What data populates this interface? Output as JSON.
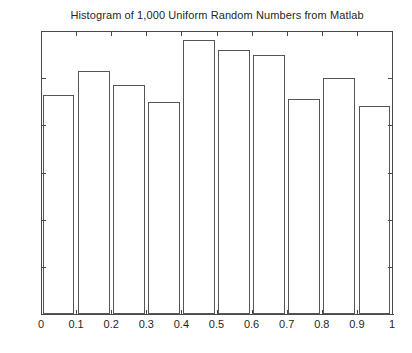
{
  "chart_data": {
    "type": "bar",
    "title": "Histogram of 1,000 Uniform Random Numbers from Matlab",
    "xlabel": "",
    "ylabel": "",
    "categories": [
      "0-0.1",
      "0.1-0.2",
      "0.2-0.3",
      "0.3-0.4",
      "0.4-0.5",
      "0.5-0.6",
      "0.6-0.7",
      "0.7-0.8",
      "0.8-0.9",
      "0.9-1"
    ],
    "bin_edges": [
      0,
      0.1,
      0.2,
      0.3,
      0.4,
      0.5,
      0.6,
      0.7,
      0.8,
      0.9,
      1
    ],
    "values": [
      93,
      103,
      97,
      90,
      116,
      112,
      110,
      91,
      100,
      88
    ],
    "xlim": [
      0,
      1
    ],
    "ylim": [
      0,
      120
    ],
    "xticks": [
      "0",
      "0.1",
      "0.2",
      "0.3",
      "0.4",
      "0.5",
      "0.6",
      "0.7",
      "0.8",
      "0.9",
      "1"
    ],
    "xtick_values": [
      0,
      0.1,
      0.2,
      0.3,
      0.4,
      0.5,
      0.6,
      0.7,
      0.8,
      0.9,
      1
    ],
    "yticks": [
      "0",
      "20",
      "40",
      "60",
      "80",
      "100",
      "120"
    ],
    "ytick_values": [
      0,
      20,
      40,
      60,
      80,
      100,
      120
    ],
    "grid": false,
    "legend": null,
    "bar_fill_color": "#ffffff",
    "bar_edge_color": "#555555",
    "axis_color": "#4a4a4a",
    "background_color": "#ffffff"
  },
  "caption": {
    "text": ""
  }
}
